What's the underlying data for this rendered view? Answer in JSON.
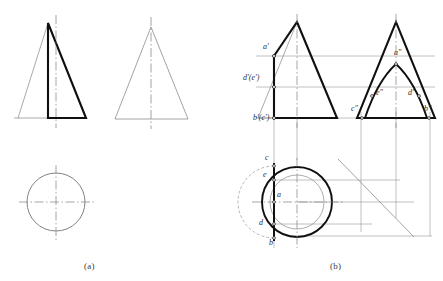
{
  "figure": {
    "captions": [
      {
        "id": "caption-a",
        "text": "(a)",
        "x": 84,
        "y": 262
      },
      {
        "id": "caption-b",
        "text": "(b)",
        "x": 330,
        "y": 262
      }
    ]
  },
  "colors": {
    "thick_line": "#101010",
    "thin_line": "#6b6b6b",
    "center_line": "#8a8a8a",
    "projection_line": "#7d7d7d",
    "text": "#2b2b2b",
    "caption_text": "#3a3a3a",
    "background": "#ffffff"
  },
  "line_weights": {
    "thick": 2.1,
    "medium": 1.0,
    "thin": 0.65,
    "center": 0.6
  },
  "panel_a": {
    "name": "panel-a",
    "front_view": {
      "name": "front-view-a",
      "thick_outline": [
        [
          48,
          23
        ],
        [
          86,
          118
        ],
        [
          48,
          118
        ],
        [
          48,
          61
        ]
      ],
      "thin_triangle": [
        [
          48,
          23
        ],
        [
          18,
          118
        ],
        [
          86,
          118
        ]
      ],
      "centerline": {
        "x": 56,
        "y1": 15,
        "y2": 128
      }
    },
    "side_view": {
      "name": "side-view-a",
      "thin_triangle": [
        [
          151,
          27
        ],
        [
          115,
          119
        ],
        [
          188,
          119
        ]
      ],
      "centerline": {
        "x": 151,
        "y1": 17,
        "y2": 129
      }
    },
    "top_view": {
      "name": "top-view-a",
      "circle": {
        "cx": 56,
        "cy": 202,
        "r": 29
      },
      "centerline_h": {
        "y": 202,
        "x1": 19,
        "x2": 94
      },
      "centerline_v": {
        "x": 56,
        "y1": 165,
        "y2": 240
      }
    }
  },
  "panel_b": {
    "name": "panel-b",
    "front_view": {
      "name": "front-view-b",
      "thick_outline": [
        [
          297,
          22
        ],
        [
          337,
          118
        ],
        [
          274,
          118
        ],
        [
          274,
          56
        ]
      ],
      "thin_triangle": [
        [
          297,
          22
        ],
        [
          258,
          118
        ],
        [
          337,
          118
        ]
      ],
      "centerline": {
        "x": 297,
        "y1": 14,
        "y2": 128
      },
      "points": [
        {
          "id": "a-prime",
          "x": 274,
          "y": 56
        },
        {
          "id": "de-prime",
          "x": 274,
          "y": 87
        },
        {
          "id": "bc-prime",
          "x": 274,
          "y": 118
        }
      ],
      "labels": [
        {
          "id": "label-a-prime",
          "text": "a′",
          "x": 266,
          "y": 48
        },
        {
          "id": "label-de-prime",
          "text": "d′(e′)",
          "x": 246,
          "y": 79
        },
        {
          "id": "label-bc-prime",
          "text": "b′(c′)",
          "x": 256,
          "y": 118
        }
      ]
    },
    "side_view": {
      "name": "side-view-b",
      "thick_triangle": [
        [
          396,
          22
        ],
        [
          357,
          118
        ],
        [
          435,
          118
        ]
      ],
      "hyperbola": {
        "apex": [
          396,
          64
        ],
        "left_end": [
          365,
          118
        ],
        "right_end": [
          427,
          118
        ]
      },
      "centerline": {
        "x": 396,
        "y1": 14,
        "y2": 128
      },
      "points": [
        {
          "id": "a-dbl-prime",
          "x": 396,
          "y": 64
        },
        {
          "id": "e-dbl-prime",
          "x": 371,
          "y": 96
        },
        {
          "id": "d-dbl-prime",
          "x": 418,
          "y": 96
        },
        {
          "id": "c-dbl-prime",
          "x": 361,
          "y": 118
        },
        {
          "id": "b-dbl-prime",
          "x": 430,
          "y": 118
        }
      ],
      "labels": [
        {
          "id": "label-a-dbl-prime",
          "text": "a″",
          "x": 398,
          "y": 54
        },
        {
          "id": "label-e-dbl-prime",
          "text": "e″",
          "x": 378,
          "y": 94
        },
        {
          "id": "label-d-dbl-prime",
          "text": "d″",
          "x": 410,
          "y": 94
        },
        {
          "id": "label-c-dbl-prime",
          "text": "c″",
          "x": 354,
          "y": 110
        },
        {
          "id": "label-b-dbl-prime",
          "text": "b″",
          "x": 427,
          "y": 110
        }
      ]
    },
    "top_view": {
      "name": "top-view-b",
      "outer_circle": {
        "cx": 297,
        "cy": 202,
        "r": 35
      },
      "inner_circle": {
        "cx": 297,
        "cy": 202,
        "r": 27
      },
      "chord": {
        "x": 274,
        "y1": 163,
        "y2": 241
      },
      "centerline_h": {
        "y": 202,
        "x1": 252,
        "x2": 345
      },
      "centerline_v": {
        "x": 297,
        "y1": 158,
        "y2": 248
      },
      "points": [
        {
          "id": "point-c",
          "x": 274,
          "y": 166
        },
        {
          "id": "point-e",
          "x": 274,
          "y": 180
        },
        {
          "id": "point-a",
          "x": 274,
          "y": 202
        },
        {
          "id": "point-d",
          "x": 274,
          "y": 224
        },
        {
          "id": "point-b",
          "x": 274,
          "y": 238
        }
      ],
      "labels": [
        {
          "id": "label-c",
          "text": "c",
          "x": 266,
          "y": 157
        },
        {
          "id": "label-e",
          "text": "e",
          "x": 264,
          "y": 173
        },
        {
          "id": "label-a",
          "text": "a",
          "x": 278,
          "y": 194
        },
        {
          "id": "label-d",
          "text": "d",
          "x": 261,
          "y": 222
        },
        {
          "id": "label-b",
          "text": "b",
          "x": 270,
          "y": 241
        }
      ]
    },
    "projection": {
      "name": "projection-construction",
      "miter_line": {
        "x1": 340,
        "y1": 161,
        "x2": 412,
        "y2": 235
      },
      "horizontal_rays": [
        {
          "y": 56,
          "x1": 256,
          "x2": 435
        },
        {
          "y": 87,
          "x1": 256,
          "x2": 435
        },
        {
          "y": 118,
          "x1": 256,
          "x2": 435
        }
      ],
      "vertical_rays": [
        {
          "x": 274,
          "y1": 110,
          "y2": 248
        },
        {
          "x": 297,
          "y1": 120,
          "y2": 158
        },
        {
          "x": 361,
          "y1": 110,
          "y2": 232
        },
        {
          "x": 396,
          "y1": 110,
          "y2": 218
        },
        {
          "x": 430,
          "y1": 110,
          "y2": 235
        }
      ],
      "horizontal_tie_lines": [
        {
          "y": 180,
          "x1": 270,
          "x2": 400
        },
        {
          "y": 202,
          "x1": 296,
          "x2": 412
        },
        {
          "y": 224,
          "x1": 270,
          "x2": 370
        },
        {
          "y": 235,
          "x1": 286,
          "x2": 432
        }
      ]
    }
  }
}
